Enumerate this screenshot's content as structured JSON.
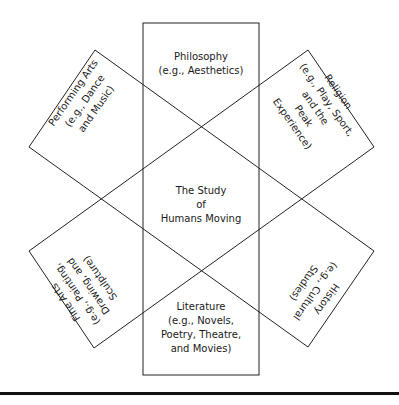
{
  "diagram": {
    "center": {
      "lines": [
        "The Study",
        "of",
        "Humans Moving"
      ]
    },
    "boxes": {
      "top": {
        "lines": [
          "Philosophy",
          "(e.g., Aesthetics)"
        ]
      },
      "bottom": {
        "lines": [
          "Literature",
          "(e.g., Novels,",
          "Poetry, Theatre,",
          "and Movies)"
        ]
      },
      "upper_left": {
        "lines": [
          "Performing Arts",
          "(e.g., Dance",
          "and Music)"
        ]
      },
      "upper_right": {
        "lines": [
          "Religion",
          "(e.g., Play, Sport,",
          "and the",
          "Peak",
          "Experience)"
        ]
      },
      "lower_left": {
        "lines": [
          "Fine Arts",
          "(e.g., Painting,",
          "Drawing, and",
          "Sculpture)"
        ]
      },
      "lower_right": {
        "lines": [
          "History",
          "(e.g., Cultural",
          "Studies)"
        ]
      }
    },
    "colors": {
      "stroke": "#222222",
      "text": "#1a1a1a",
      "background": "#ffffff"
    }
  }
}
